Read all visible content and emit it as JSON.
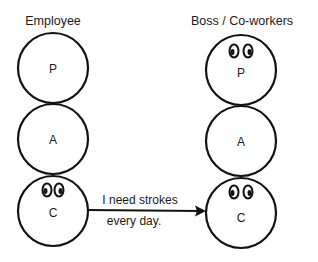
{
  "diagram": {
    "left": {
      "title": "Employee",
      "states": [
        {
          "label": "P",
          "has_eyes": false
        },
        {
          "label": "A",
          "has_eyes": false
        },
        {
          "label": "C",
          "has_eyes": true
        }
      ]
    },
    "right": {
      "title": "Boss / Co-workers",
      "states": [
        {
          "label": "P",
          "has_eyes": true
        },
        {
          "label": "A",
          "has_eyes": false
        },
        {
          "label": "C",
          "has_eyes": true
        }
      ]
    },
    "transaction": {
      "from": "Employee C",
      "to": "Boss/Co-workers C",
      "line1": "I need strokes",
      "line2": "every day."
    },
    "colors": {
      "ink": "#111111",
      "background": "#ffffff"
    }
  }
}
